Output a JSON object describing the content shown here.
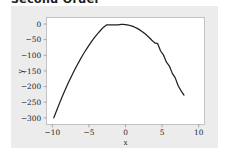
{
  "page": {
    "heading": "Second Order"
  },
  "figure": {
    "background_color": "#ececed",
    "plot_background_color": "#ffffff",
    "border_color": "#b6b6b8"
  },
  "chart_data": {
    "type": "line",
    "title": "",
    "xlabel": "x",
    "ylabel": "y",
    "xlim": [
      -10.8,
      10.8
    ],
    "ylim": [
      -318,
      24
    ],
    "xticks": [
      -10,
      -5,
      0,
      5,
      10
    ],
    "xticklabels": [
      "−10",
      "−5",
      "0",
      "5",
      "10"
    ],
    "yticks": [
      0,
      -50,
      -100,
      -150,
      -200,
      -250,
      -300
    ],
    "yticklabels": [
      "0",
      "−50",
      "−100",
      "−150",
      "−200",
      "−250",
      "−300"
    ],
    "grid": false,
    "legend": false,
    "series": [
      {
        "name": "y",
        "color": "#231f20",
        "equation": "y = -3.2(x + 0.4)^2 + 2",
        "x": [
          -9.8,
          -9.4,
          -9.0,
          -8.6,
          -8.2,
          -7.8,
          -7.4,
          -7.0,
          -6.6,
          -6.2,
          -5.8,
          -5.4,
          -5.0,
          -4.6,
          -4.2,
          -3.8,
          -3.4,
          -3.0,
          -2.6,
          -2.2,
          -1.8,
          -1.4,
          -1.0,
          -0.6,
          -0.4,
          0.0,
          0.4,
          0.8,
          1.2,
          1.6,
          2.0,
          2.4,
          2.8,
          3.2,
          3.6,
          4.0,
          4.4,
          4.8,
          5.2,
          5.6,
          6.0,
          6.4,
          6.8,
          7.2,
          7.6,
          8.0
        ],
        "y": [
          -296.6,
          -272.3,
          -248.9,
          -226.4,
          -204.8,
          -184.1,
          -164.4,
          -145.5,
          -127.6,
          -110.5,
          -94.4,
          -79.2,
          -64.9,
          -51.5,
          -39.0,
          -27.4,
          -16.7,
          -6.9,
          0.1,
          0.4,
          0.6,
          0.8,
          0.8,
          2.0,
          2.0,
          1.5,
          0.0,
          -2.6,
          -6.2,
          -10.8,
          -16.4,
          -23.0,
          -30.5,
          -39.1,
          -48.6,
          -57.1,
          -59.6,
          -83.1,
          -96.5,
          -118.9,
          -131.3,
          -154.6,
          -168.9,
          -194.2,
          -210.5,
          -223.8
        ]
      }
    ]
  }
}
